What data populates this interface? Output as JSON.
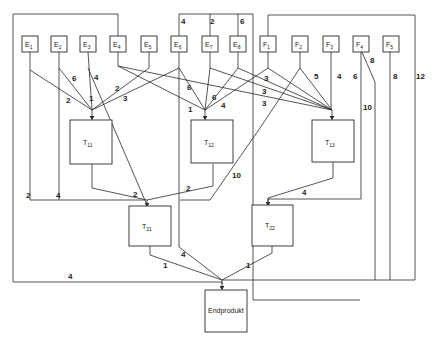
{
  "diagram": {
    "type": "bill-of-materials graph (Gozinto graph)",
    "raw_materials": [
      {
        "id": "E1",
        "label": "E",
        "sub": "1"
      },
      {
        "id": "E2",
        "label": "E",
        "sub": "2"
      },
      {
        "id": "E3",
        "label": "E",
        "sub": "3"
      },
      {
        "id": "E4",
        "label": "E",
        "sub": "4"
      },
      {
        "id": "E5",
        "label": "E",
        "sub": "5"
      },
      {
        "id": "E6",
        "label": "E",
        "sub": "6"
      },
      {
        "id": "E7",
        "label": "E",
        "sub": "7"
      },
      {
        "id": "E8",
        "label": "E",
        "sub": "8"
      },
      {
        "id": "F1",
        "label": "F",
        "sub": "1"
      },
      {
        "id": "F2",
        "label": "F",
        "sub": "2"
      },
      {
        "id": "F3",
        "label": "F",
        "sub": "3"
      },
      {
        "id": "F4",
        "label": "F",
        "sub": "4"
      },
      {
        "id": "F5",
        "label": "F",
        "sub": "5"
      }
    ],
    "assemblies": [
      {
        "id": "T11",
        "label": "T",
        "sub": "11"
      },
      {
        "id": "T12",
        "label": "T",
        "sub": "12"
      },
      {
        "id": "T13",
        "label": "T",
        "sub": "13"
      },
      {
        "id": "T21",
        "label": "T",
        "sub": "21"
      },
      {
        "id": "T22",
        "label": "T",
        "sub": "22"
      }
    ],
    "final_product": {
      "id": "Endprodukt",
      "label": "Endprodukt"
    },
    "quantities": {
      "E2_T11": "6",
      "E1_T11": "2",
      "E3_T11": "1",
      "E5_T11": "2",
      "E4_T11": "3",
      "E3_T21": "4",
      "E6_T12": "1",
      "E4_T12": "6",
      "E7_T12": "6",
      "E8_T12": "4",
      "E7_T13": "3",
      "E8_T13": "3",
      "E6_T13": "3",
      "F2_T13": "5",
      "F3_T13": "4",
      "F4_T13": "6",
      "E6_top": "4",
      "E7_top": "2",
      "E8_top": "6",
      "F4_T22": "10",
      "F4_end": "8",
      "F5_end": "8",
      "F1_end": "12",
      "E1_T21": "2",
      "E2_T21": "4",
      "T11_T21": "2",
      "T12_T21": "2",
      "F1_T21": "10",
      "T13_T22": "4",
      "T21_end": "1",
      "T22_end": "1",
      "E6_end": "4",
      "E4_end": "4"
    }
  }
}
